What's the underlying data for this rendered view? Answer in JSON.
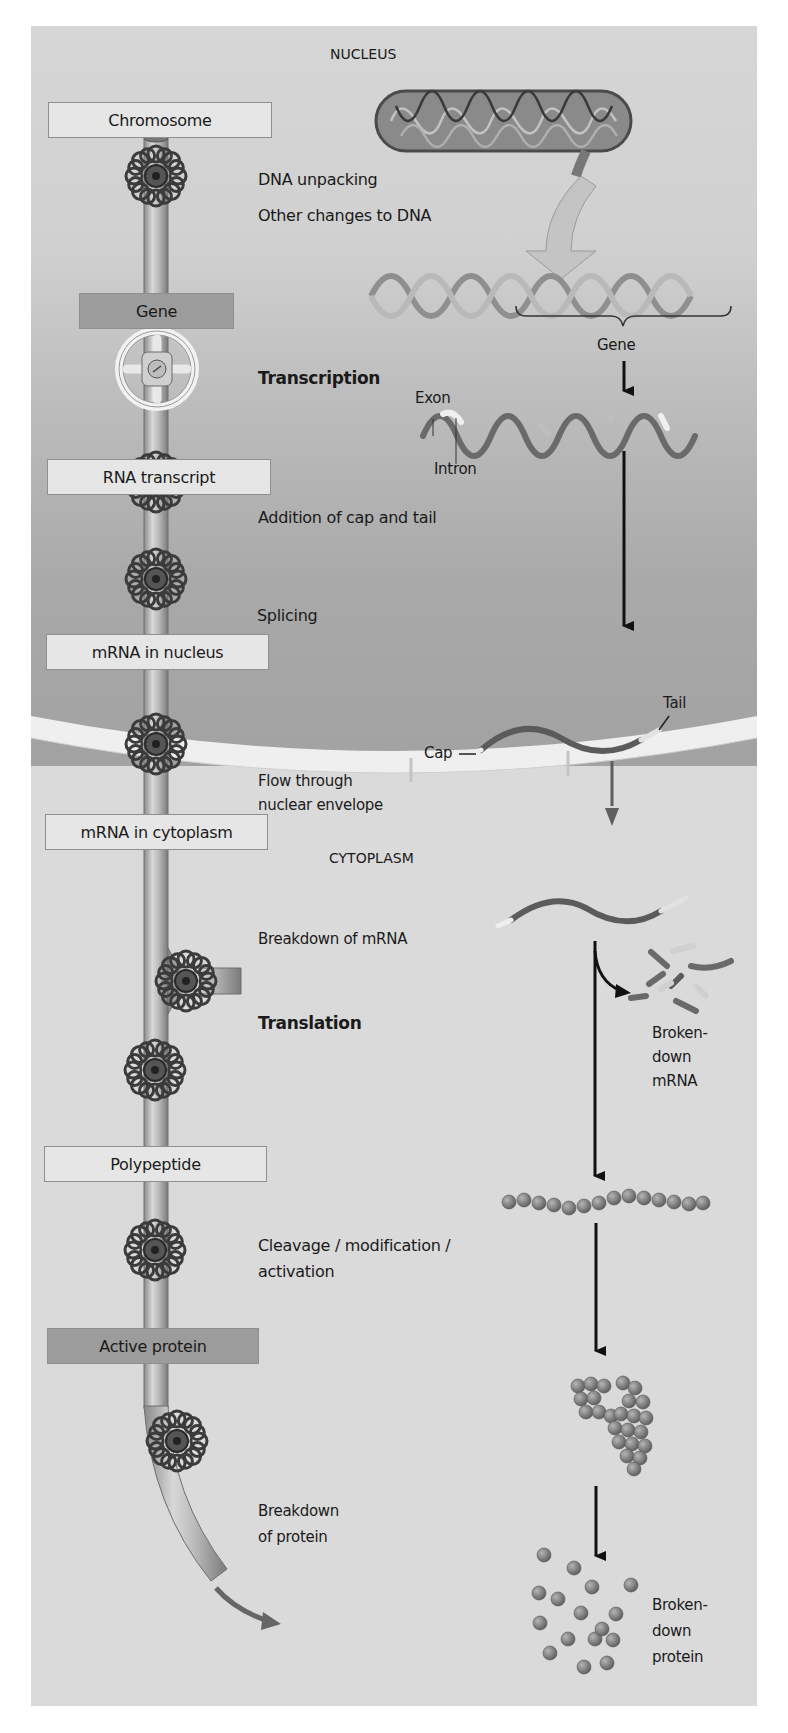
{
  "regions": {
    "nucleus": "NUCLEUS",
    "cytoplasm": "CYTOPLASM"
  },
  "stages": [
    {
      "label": "Chromosome",
      "style": "light"
    },
    {
      "label": "Gene",
      "style": "dark"
    },
    {
      "label": "RNA transcript",
      "style": "light"
    },
    {
      "label": "mRNA in nucleus",
      "style": "light"
    },
    {
      "label": "mRNA in cytoplasm",
      "style": "light"
    },
    {
      "label": "Polypeptide",
      "style": "light"
    },
    {
      "label": "Active protein",
      "style": "dark"
    }
  ],
  "control_points": {
    "dna_unpacking": "DNA unpacking",
    "other_changes": "Other changes to DNA",
    "transcription": "Transcription",
    "cap_tail": "Addition of cap and tail",
    "splicing": "Splicing",
    "flow_1": "Flow through",
    "flow_2": "nuclear envelope",
    "breakdown_mrna": "Breakdown of mRNA",
    "translation": "Translation",
    "cleavage_1": "Cleavage / modification  /",
    "cleavage_2": "activation",
    "breakdown_protein_1": "Breakdown",
    "breakdown_protein_2": "of protein"
  },
  "illustration_labels": {
    "gene": "Gene",
    "exon": "Exon",
    "intron": "Intron",
    "cap": "Cap",
    "tail": "Tail",
    "broken_mrna_1": "Broken-",
    "broken_mrna_2": "down",
    "broken_mrna_3": "mRNA",
    "broken_protein_1": "Broken-",
    "broken_protein_2": "down",
    "broken_protein_3": "protein"
  },
  "colors": {
    "nucleus_top": "#d6d6d6",
    "nucleus_bottom": "#a2a2a2",
    "cytoplasm": "#dadada",
    "envelope": "#f0f0f0",
    "label_light": "#e6e6e6",
    "label_dark": "#9c9c9c",
    "arrow": "#111111"
  }
}
